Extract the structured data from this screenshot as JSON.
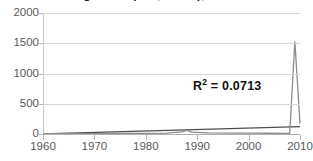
{
  "chart_data": {
    "type": "line",
    "title": "Average Grant (U.S., Health), 1960-2010",
    "xlabel": "",
    "ylabel": "",
    "xlim": [
      1960,
      2010
    ],
    "ylim": [
      0,
      2000
    ],
    "grid": true,
    "legend_position": "none",
    "x_ticks": [
      "1960",
      "1970",
      "1980",
      "1990",
      "2000",
      "2010"
    ],
    "x_tick_values": [
      1960,
      1970,
      1980,
      1990,
      2000,
      2010
    ],
    "y_ticks": [
      "0",
      "500",
      "1000",
      "1500",
      "2000"
    ],
    "y_tick_values": [
      0,
      500,
      1000,
      1500,
      2000
    ],
    "series": [
      {
        "name": "Average Grant",
        "color": "#8c8c8c",
        "x": [
          1960,
          1965,
          1970,
          1975,
          1980,
          1984,
          1987,
          1988,
          1989,
          1992,
          1996,
          2000,
          2004,
          2007,
          2008,
          2009,
          2010
        ],
        "values": [
          4,
          5,
          6,
          8,
          10,
          14,
          35,
          58,
          30,
          18,
          16,
          14,
          12,
          10,
          8,
          1530,
          170
        ]
      },
      {
        "name": "Linear trend",
        "color": "#4d4d4d",
        "x": [
          1960,
          2010
        ],
        "values": [
          2,
          122
        ]
      }
    ],
    "annotations": [
      {
        "name": "r-squared",
        "prefix": "R",
        "superscript": "2",
        "suffix": " = 0.0713",
        "text": "R2 = 0.0713",
        "value": 0.0713
      }
    ],
    "colors": {
      "series": "#8c8c8c",
      "trend": "#4d4d4d",
      "gridline": "#d6d6d6",
      "axis": "#b5b5b5",
      "tick_label": "#595959",
      "annotation": "#111111",
      "background": "#ffffff"
    }
  }
}
